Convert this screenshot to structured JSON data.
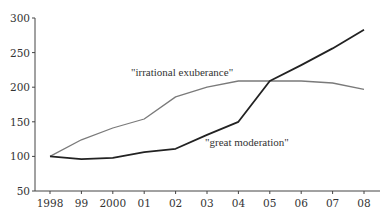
{
  "chart_data": {
    "type": "line",
    "title": "",
    "xlabel": "",
    "ylabel": "",
    "categories": [
      "1998",
      "99",
      "2000",
      "01",
      "02",
      "03",
      "04",
      "05",
      "06",
      "07",
      "08"
    ],
    "ylim": [
      50,
      300
    ],
    "yticks": [
      50,
      100,
      150,
      200,
      250,
      300
    ],
    "grid": false,
    "legend": "none (inline annotations)",
    "series": [
      {
        "name": "\"irrational exuberance\"",
        "color": "#7a7a7a",
        "values": [
          100,
          124,
          141,
          154,
          186,
          200,
          209,
          209,
          209,
          206,
          197
        ]
      },
      {
        "name": "\"great moderation\"",
        "color": "#222222",
        "values": [
          100,
          96,
          98,
          106,
          111,
          131,
          150,
          209,
          232,
          256,
          283
        ]
      }
    ],
    "annotations": [
      {
        "text": "\"irrational exuberance\"",
        "series": 0
      },
      {
        "text": "\"great moderation\"",
        "series": 1
      }
    ]
  },
  "labels": {
    "irrational": "\"irrational exuberance\"",
    "moderation": "\"great moderation\""
  }
}
